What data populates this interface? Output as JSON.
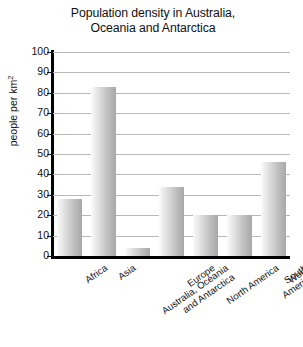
{
  "chart_data": {
    "type": "bar",
    "title": "Population density in Australia, Oceania and Antarctica",
    "title_line1": "Population density in Australia,",
    "title_line2": "Oceania and Antarctica",
    "xlabel": "",
    "ylabel": "people per km",
    "ylabel_sup": "2",
    "categories": [
      "Africa",
      "Asia",
      "Australia, Oceania\nand Antarctica",
      "Europe",
      "North America",
      "South America",
      "World"
    ],
    "values": [
      28,
      83,
      4,
      34,
      20,
      20,
      46
    ],
    "ylim": [
      0,
      100
    ],
    "yticks": [
      100,
      90,
      80,
      70,
      60,
      50,
      40,
      30,
      20,
      10,
      0
    ],
    "grid": true,
    "legend": "none",
    "bar_color_light": "#fcfcfc",
    "bar_color_dark": "#a8a8a8",
    "axis_color": "#000000",
    "gridline_color": "#b8b8b8"
  }
}
